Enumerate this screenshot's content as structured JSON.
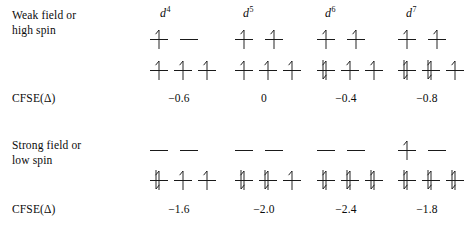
{
  "figure": {
    "type": "crystal-field-splitting-diagram",
    "columns": [
      {
        "key": "d4",
        "symbol": "d",
        "superscript": "4",
        "label": "d4"
      },
      {
        "key": "d5",
        "symbol": "d",
        "superscript": "5",
        "label": "d5"
      },
      {
        "key": "d6",
        "symbol": "d",
        "superscript": "6",
        "label": "d6"
      },
      {
        "key": "d7",
        "symbol": "d",
        "superscript": "7",
        "label": "d7"
      }
    ],
    "sections": [
      {
        "key": "weak",
        "label": "Weak field or\nhigh spin",
        "cfse_label": "CFSE(Δ)",
        "cfse_values": [
          "−0.6",
          "0",
          "−0.4",
          "−0.8"
        ],
        "configurations": [
          {
            "column": "d4",
            "eg": [
              "up",
              "empty"
            ],
            "t2g": [
              "up",
              "up",
              "up"
            ]
          },
          {
            "column": "d5",
            "eg": [
              "up",
              "up"
            ],
            "t2g": [
              "up",
              "up",
              "up"
            ]
          },
          {
            "column": "d6",
            "eg": [
              "up",
              "up"
            ],
            "t2g": [
              "pair",
              "up",
              "up"
            ]
          },
          {
            "column": "d7",
            "eg": [
              "up",
              "up"
            ],
            "t2g": [
              "pair",
              "pair",
              "up"
            ]
          }
        ]
      },
      {
        "key": "strong",
        "label": "Strong field or\nlow spin",
        "cfse_label": "CFSE(Δ)",
        "cfse_values": [
          "−1.6",
          "−2.0",
          "−2.4",
          "−1.8"
        ],
        "configurations": [
          {
            "column": "d4",
            "eg": [
              "empty",
              "empty"
            ],
            "t2g": [
              "pair",
              "up",
              "up"
            ]
          },
          {
            "column": "d5",
            "eg": [
              "empty",
              "empty"
            ],
            "t2g": [
              "pair",
              "pair",
              "up"
            ]
          },
          {
            "column": "d6",
            "eg": [
              "empty",
              "empty"
            ],
            "t2g": [
              "pair",
              "pair",
              "pair"
            ]
          },
          {
            "column": "d7",
            "eg": [
              "up",
              "empty"
            ],
            "t2g": [
              "pair",
              "pair",
              "pair"
            ]
          }
        ]
      }
    ],
    "colors": {
      "ink": "#0b0b0b",
      "line": "#1a1a1a",
      "background": "#ffffff"
    }
  },
  "layout": {
    "column_x": [
      148,
      233,
      315,
      396
    ],
    "header_x": [
      160,
      243,
      325,
      406
    ],
    "eg_offsets": [
      0,
      30
    ],
    "t2g_offsets": [
      0,
      24,
      48
    ],
    "weak": {
      "label_y": 8,
      "eg_y": 26,
      "t2g_y": 57,
      "cfse_y": 92
    },
    "strong": {
      "label_y": 138,
      "eg_y": 137,
      "t2g_y": 167,
      "cfse_y": 203
    }
  }
}
